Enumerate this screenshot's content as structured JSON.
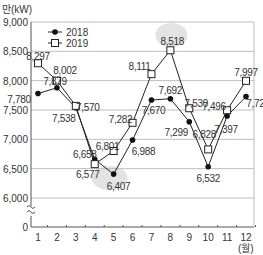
{
  "chart_data": {
    "type": "line",
    "title": "",
    "unit_label": "만(kW)",
    "xlabel": "(월)",
    "ylabel": "만(kW)",
    "categories": [
      "1",
      "2",
      "3",
      "4",
      "5",
      "6",
      "7",
      "8",
      "9",
      "10",
      "11",
      "12"
    ],
    "series": [
      {
        "name": "2018",
        "marker": "filled-circle",
        "values": [
          7780,
          7879,
          7538,
          6658,
          6407,
          6988,
          7670,
          7692,
          7299,
          6532,
          7397,
          7728
        ],
        "labels": [
          "7,780",
          "7,879",
          "7,538",
          "6,658",
          "6,407",
          "6,988",
          "7,670",
          "7,692",
          "7,299",
          "6,532",
          "7,397",
          "7,728"
        ]
      },
      {
        "name": "2019",
        "marker": "open-square",
        "values": [
          8297,
          8002,
          7570,
          6577,
          6801,
          7282,
          8111,
          8518,
          7530,
          6828,
          7496,
          7997
        ],
        "labels": [
          "8,297",
          "8,002",
          "7,570",
          "6,577",
          "6,801",
          "7,282",
          "8,111",
          "8,518",
          "7,530",
          "6,828",
          "7,496",
          "7,997"
        ]
      }
    ],
    "y_ticks": [
      "9,000",
      "8,500",
      "8,000",
      "7,500",
      "7,000",
      "6,500",
      "6,000",
      "0"
    ],
    "ylim": [
      6000,
      9000
    ],
    "y_axis_break": true,
    "grid": true,
    "legend_position": "top-left",
    "highlights": [
      "8 (2019 peak 8,518)",
      "5 (2018 low 6,407)"
    ]
  }
}
